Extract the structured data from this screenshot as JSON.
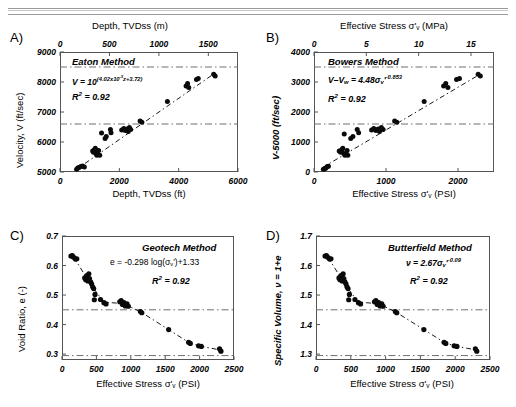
{
  "figure": {
    "panels": [
      {
        "tag": "A)",
        "method": "Eaton Method",
        "equation_main": "V = 10",
        "equation_exp": "(4.02x10",
        "equation_exp2": "-5",
        "equation_exp3": "z+3.72)",
        "r2": "R",
        "r2_sup": "2",
        "r2_val": " = 0.92",
        "top_axis_title": "Depth, TVDss (m)",
        "bottom_axis_title": "Depth, TVDss (ft)",
        "y_axis_title": "Velocity, V (ft/sec)",
        "top_ticks": [
          "0",
          "500",
          "1000",
          "1500"
        ],
        "bottom_ticks": [
          "0",
          "2000",
          "4000",
          "6000"
        ],
        "y_ticks": [
          "9000",
          "8000",
          "7000",
          "6000",
          "5000"
        ]
      },
      {
        "tag": "B)",
        "method": "Bowers Method",
        "equation_main": "V–V",
        "equation_sub": "w",
        "equation_rest": " = 4.48σ",
        "equation_sub2": "v",
        "equation_prime": "'",
        "equation_exp": "-0.853",
        "r2": "R",
        "r2_sup": "2",
        "r2_val": " = 0.92",
        "top_axis_title": "Effective Stress σ'v (MPa)",
        "bottom_axis_title": "Effective Stress σ'v (PSI)",
        "y_axis_title": "V-5000 (ft/sec)",
        "top_ticks": [
          "0",
          "5",
          "10",
          "15"
        ],
        "bottom_ticks": [
          "0",
          "1000",
          "2000"
        ],
        "y_ticks": [
          "4000",
          "3000",
          "2000",
          "1000",
          "0"
        ]
      },
      {
        "tag": "C)",
        "method": "Geotech Method",
        "equation_main": "e = -0.298 log(σ",
        "equation_sub": "v",
        "equation_prime": "')",
        "equation_rest": "+1.33",
        "r2": "R",
        "r2_sup": "2",
        "r2_val": " = 0.92",
        "bottom_axis_title": "Effective Stress σ'v (PSI)",
        "y_axis_title": "Void Ratio, e (-)",
        "bottom_ticks": [
          "0",
          "500",
          "1000",
          "1500",
          "2000",
          "2500"
        ],
        "y_ticks": [
          "0.7",
          "0.6",
          "0.5",
          "0.4",
          "0.3"
        ]
      },
      {
        "tag": "D)",
        "method": "Butterfield Method",
        "equation_main": "ν = 2.67σ",
        "equation_sub": "v",
        "equation_prime": "'",
        "equation_exp": "-0.09",
        "r2": "R",
        "r2_sup": "2",
        "r2_val": " = 0.92",
        "bottom_axis_title": "Effective Stress σ'v (PSI)",
        "y_axis_title": "Specific Volume, ν = 1+e",
        "bottom_ticks": [
          "0",
          "500",
          "1000",
          "1500",
          "2000",
          "2500"
        ],
        "y_ticks": [
          "1.7",
          "1.6",
          "1.5",
          "1.4",
          "1.3"
        ]
      }
    ]
  },
  "chart_data": [
    {
      "type": "scatter",
      "panel": "A",
      "title": "Eaton Method",
      "xlabel": "Depth, TVDss (ft)",
      "ylabel": "Velocity, V (ft/sec)",
      "xlabel_top": "Depth, TVDss (m)",
      "xlim": [
        0,
        6000
      ],
      "ylim": [
        5000,
        9000
      ],
      "xlim_top": [
        0,
        1800
      ],
      "xticks": [
        0,
        2000,
        4000,
        6000
      ],
      "xticks_top": [
        0,
        500,
        1000,
        1500
      ],
      "yticks": [
        5000,
        6000,
        7000,
        8000,
        9000
      ],
      "grid": false,
      "annotation_r2": 0.92,
      "equation": "V = 10^(4.02x10^-5 z + 3.72)",
      "reference_lines_y": [
        8500,
        6600
      ],
      "trendline": {
        "style": "dash-dot",
        "x": [
          500,
          5300
        ],
        "y": [
          5050,
          8350
        ]
      },
      "points": [
        {
          "x": 560,
          "y": 5090
        },
        {
          "x": 600,
          "y": 5130
        },
        {
          "x": 640,
          "y": 5150
        },
        {
          "x": 700,
          "y": 5180
        },
        {
          "x": 760,
          "y": 5200
        },
        {
          "x": 820,
          "y": 5170
        },
        {
          "x": 1100,
          "y": 5700
        },
        {
          "x": 1130,
          "y": 5660
        },
        {
          "x": 1160,
          "y": 5740
        },
        {
          "x": 1190,
          "y": 5790
        },
        {
          "x": 1210,
          "y": 5620
        },
        {
          "x": 1240,
          "y": 5560
        },
        {
          "x": 1270,
          "y": 5600
        },
        {
          "x": 1300,
          "y": 5720
        },
        {
          "x": 1340,
          "y": 5560
        },
        {
          "x": 1400,
          "y": 6300
        },
        {
          "x": 1520,
          "y": 6120
        },
        {
          "x": 1560,
          "y": 6180
        },
        {
          "x": 1700,
          "y": 6420
        },
        {
          "x": 1720,
          "y": 6310
        },
        {
          "x": 2080,
          "y": 6400
        },
        {
          "x": 2150,
          "y": 6450
        },
        {
          "x": 2200,
          "y": 6380
        },
        {
          "x": 2260,
          "y": 6430
        },
        {
          "x": 2300,
          "y": 6350
        },
        {
          "x": 2340,
          "y": 6480
        },
        {
          "x": 2380,
          "y": 6420
        },
        {
          "x": 2700,
          "y": 6700
        },
        {
          "x": 2760,
          "y": 6660
        },
        {
          "x": 3620,
          "y": 7350
        },
        {
          "x": 4250,
          "y": 7870
        },
        {
          "x": 4300,
          "y": 7950
        },
        {
          "x": 4340,
          "y": 7820
        },
        {
          "x": 4600,
          "y": 8080
        },
        {
          "x": 4660,
          "y": 8120
        },
        {
          "x": 5180,
          "y": 8260
        },
        {
          "x": 5230,
          "y": 8200
        }
      ]
    },
    {
      "type": "scatter",
      "panel": "B",
      "title": "Bowers Method",
      "xlabel": "Effective Stress σ'v (PSI)",
      "ylabel": "V-5000 (ft/sec)",
      "xlabel_top": "Effective Stress σ'v (MPa)",
      "xlim": [
        0,
        2500
      ],
      "ylim": [
        0,
        4000
      ],
      "xlim_top": [
        0,
        17.2
      ],
      "xticks": [
        0,
        1000,
        2000
      ],
      "xticks_top": [
        0,
        5,
        10,
        15
      ],
      "yticks": [
        0,
        1000,
        2000,
        3000,
        4000
      ],
      "grid": false,
      "annotation_r2": 0.92,
      "equation": "V–Vw = 4.48σ'v^-0.853",
      "reference_lines_y": [
        3500,
        1600
      ],
      "trendline": {
        "style": "dash-dot",
        "x": [
          120,
          2300
        ],
        "y": [
          150,
          3250
        ]
      },
      "points": [
        {
          "x": 130,
          "y": 90
        },
        {
          "x": 150,
          "y": 110
        },
        {
          "x": 165,
          "y": 130
        },
        {
          "x": 185,
          "y": 180
        },
        {
          "x": 200,
          "y": 190
        },
        {
          "x": 350,
          "y": 700
        },
        {
          "x": 370,
          "y": 660
        },
        {
          "x": 385,
          "y": 740
        },
        {
          "x": 400,
          "y": 790
        },
        {
          "x": 415,
          "y": 620
        },
        {
          "x": 430,
          "y": 560
        },
        {
          "x": 445,
          "y": 600
        },
        {
          "x": 460,
          "y": 720
        },
        {
          "x": 470,
          "y": 560
        },
        {
          "x": 420,
          "y": 1270
        },
        {
          "x": 510,
          "y": 1120
        },
        {
          "x": 540,
          "y": 1180
        },
        {
          "x": 600,
          "y": 1420
        },
        {
          "x": 620,
          "y": 1310
        },
        {
          "x": 800,
          "y": 1400
        },
        {
          "x": 830,
          "y": 1450
        },
        {
          "x": 860,
          "y": 1380
        },
        {
          "x": 890,
          "y": 1430
        },
        {
          "x": 910,
          "y": 1350
        },
        {
          "x": 935,
          "y": 1480
        },
        {
          "x": 960,
          "y": 1420
        },
        {
          "x": 1120,
          "y": 1700
        },
        {
          "x": 1150,
          "y": 1660
        },
        {
          "x": 1530,
          "y": 2350
        },
        {
          "x": 1800,
          "y": 2870
        },
        {
          "x": 1830,
          "y": 2950
        },
        {
          "x": 1860,
          "y": 2820
        },
        {
          "x": 1980,
          "y": 3080
        },
        {
          "x": 2020,
          "y": 3120
        },
        {
          "x": 2280,
          "y": 3260
        },
        {
          "x": 2310,
          "y": 3200
        }
      ]
    },
    {
      "type": "scatter",
      "panel": "C",
      "title": "Geotech Method",
      "xlabel": "Effective Stress σ'v (PSI)",
      "ylabel": "Void Ratio, e (-)",
      "xlim": [
        0,
        2500
      ],
      "ylim": [
        0.28,
        0.7
      ],
      "xticks": [
        0,
        500,
        1000,
        1500,
        2000,
        2500
      ],
      "yticks": [
        0.3,
        0.4,
        0.5,
        0.6,
        0.7
      ],
      "grid": false,
      "annotation_r2": 0.92,
      "equation": "e = -0.298 log(σ'v)+1.33",
      "reference_lines_y": [
        0.45,
        0.295
      ],
      "trendline": {
        "style": "dash-dot"
      },
      "points": [
        {
          "x": 130,
          "y": 0.632
        },
        {
          "x": 150,
          "y": 0.634
        },
        {
          "x": 170,
          "y": 0.628
        },
        {
          "x": 195,
          "y": 0.622
        },
        {
          "x": 215,
          "y": 0.623
        },
        {
          "x": 330,
          "y": 0.558
        },
        {
          "x": 345,
          "y": 0.552
        },
        {
          "x": 360,
          "y": 0.566
        },
        {
          "x": 375,
          "y": 0.548
        },
        {
          "x": 390,
          "y": 0.572
        },
        {
          "x": 400,
          "y": 0.556
        },
        {
          "x": 415,
          "y": 0.545
        },
        {
          "x": 430,
          "y": 0.538
        },
        {
          "x": 445,
          "y": 0.528
        },
        {
          "x": 460,
          "y": 0.522
        },
        {
          "x": 480,
          "y": 0.502
        },
        {
          "x": 470,
          "y": 0.484
        },
        {
          "x": 560,
          "y": 0.485
        },
        {
          "x": 610,
          "y": 0.474
        },
        {
          "x": 640,
          "y": 0.47
        },
        {
          "x": 840,
          "y": 0.477
        },
        {
          "x": 860,
          "y": 0.481
        },
        {
          "x": 880,
          "y": 0.468
        },
        {
          "x": 900,
          "y": 0.474
        },
        {
          "x": 920,
          "y": 0.463
        },
        {
          "x": 945,
          "y": 0.47
        },
        {
          "x": 965,
          "y": 0.462
        },
        {
          "x": 1140,
          "y": 0.444
        },
        {
          "x": 1160,
          "y": 0.44
        },
        {
          "x": 1550,
          "y": 0.383
        },
        {
          "x": 1840,
          "y": 0.34
        },
        {
          "x": 1865,
          "y": 0.336
        },
        {
          "x": 1985,
          "y": 0.328
        },
        {
          "x": 2025,
          "y": 0.326
        },
        {
          "x": 2290,
          "y": 0.318
        },
        {
          "x": 2310,
          "y": 0.31
        }
      ]
    },
    {
      "type": "scatter",
      "panel": "D",
      "title": "Butterfield Method",
      "xlabel": "Effective Stress σ'v (PSI)",
      "ylabel": "Specific Volume, ν = 1+e",
      "xlim": [
        0,
        2500
      ],
      "ylim": [
        1.28,
        1.7
      ],
      "xticks": [
        0,
        500,
        1000,
        1500,
        2000,
        2500
      ],
      "yticks": [
        1.3,
        1.4,
        1.5,
        1.6,
        1.7
      ],
      "grid": false,
      "annotation_r2": 0.92,
      "equation": "ν = 2.67σ'v^-0.09",
      "reference_lines_y": [
        1.45,
        1.295
      ],
      "trendline": {
        "style": "dash-dot"
      },
      "points": [
        {
          "x": 130,
          "y": 1.632
        },
        {
          "x": 150,
          "y": 1.634
        },
        {
          "x": 170,
          "y": 1.628
        },
        {
          "x": 195,
          "y": 1.622
        },
        {
          "x": 215,
          "y": 1.623
        },
        {
          "x": 330,
          "y": 1.558
        },
        {
          "x": 345,
          "y": 1.552
        },
        {
          "x": 360,
          "y": 1.566
        },
        {
          "x": 375,
          "y": 1.548
        },
        {
          "x": 390,
          "y": 1.572
        },
        {
          "x": 400,
          "y": 1.556
        },
        {
          "x": 415,
          "y": 1.545
        },
        {
          "x": 430,
          "y": 1.538
        },
        {
          "x": 445,
          "y": 1.528
        },
        {
          "x": 460,
          "y": 1.522
        },
        {
          "x": 480,
          "y": 1.502
        },
        {
          "x": 470,
          "y": 1.484
        },
        {
          "x": 560,
          "y": 1.485
        },
        {
          "x": 610,
          "y": 1.474
        },
        {
          "x": 640,
          "y": 1.47
        },
        {
          "x": 840,
          "y": 1.477
        },
        {
          "x": 860,
          "y": 1.481
        },
        {
          "x": 880,
          "y": 1.468
        },
        {
          "x": 900,
          "y": 1.474
        },
        {
          "x": 920,
          "y": 1.463
        },
        {
          "x": 945,
          "y": 1.47
        },
        {
          "x": 965,
          "y": 1.462
        },
        {
          "x": 1140,
          "y": 1.444
        },
        {
          "x": 1160,
          "y": 1.44
        },
        {
          "x": 1550,
          "y": 1.383
        },
        {
          "x": 1840,
          "y": 1.34
        },
        {
          "x": 1865,
          "y": 1.336
        },
        {
          "x": 1985,
          "y": 1.328
        },
        {
          "x": 2025,
          "y": 1.326
        },
        {
          "x": 2290,
          "y": 1.318
        },
        {
          "x": 2310,
          "y": 1.31
        }
      ]
    }
  ]
}
